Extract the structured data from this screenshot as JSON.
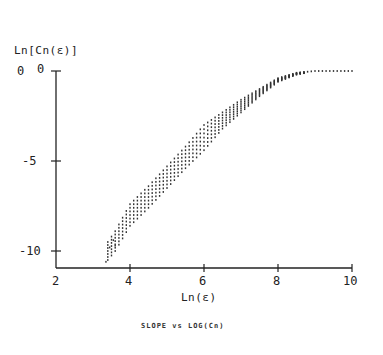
{
  "chart_data": {
    "type": "scatter",
    "title": "",
    "caption": "SLOPE vs LOG(Cn)",
    "xlabel": "Ln(ε)",
    "ylabel": "Ln[Cn(ε)]",
    "xlim": [
      2,
      10
    ],
    "ylim": [
      -11,
      0
    ],
    "x_ticks": [
      2,
      4,
      6,
      8,
      10
    ],
    "x_tick_labels": [
      "2",
      "4",
      "6",
      "8",
      "10"
    ],
    "y_ticks": [
      0,
      -5,
      -10
    ],
    "y_tick_labels": [
      "0",
      "-5",
      "-10"
    ],
    "y_extra_label": "0",
    "grid": false,
    "legend": null,
    "series": [
      {
        "name": "correlation sum curves",
        "description": "Band of densely-spaced dotted curves, rising roughly linearly then saturating at 0",
        "band": [
          {
            "x": 3.4,
            "y_low": -10.5,
            "y_high": -9.5
          },
          {
            "x": 3.6,
            "y_low": -10.0,
            "y_high": -8.9
          },
          {
            "x": 4.0,
            "y_low": -8.6,
            "y_high": -7.4
          },
          {
            "x": 4.5,
            "y_low": -7.6,
            "y_high": -6.4
          },
          {
            "x": 5.0,
            "y_low": -6.5,
            "y_high": -5.3
          },
          {
            "x": 5.5,
            "y_low": -5.4,
            "y_high": -4.2
          },
          {
            "x": 6.0,
            "y_low": -4.4,
            "y_high": -3.0
          },
          {
            "x": 6.5,
            "y_low": -3.2,
            "y_high": -2.3
          },
          {
            "x": 7.0,
            "y_low": -2.3,
            "y_high": -1.6
          },
          {
            "x": 7.5,
            "y_low": -1.4,
            "y_high": -1.0
          },
          {
            "x": 8.0,
            "y_low": -0.6,
            "y_high": -0.4
          },
          {
            "x": 8.5,
            "y_low": -0.2,
            "y_high": -0.1
          },
          {
            "x": 9.0,
            "y_low": 0.0,
            "y_high": 0.0
          },
          {
            "x": 9.5,
            "y_low": 0.0,
            "y_high": 0.0
          },
          {
            "x": 10.0,
            "y_low": 0.0,
            "y_high": 0.0
          }
        ]
      }
    ]
  },
  "labels": {
    "ylabel": "Ln[Cn(ε)]",
    "xlabel": "Ln(ε)",
    "caption": "SLOPE vs LOG(Cn)",
    "y_extra": "0",
    "y0": "0",
    "y5": "-5",
    "y10": "-10",
    "x2": "2",
    "x4": "4",
    "x6": "6",
    "x8": "8",
    "x10": "10"
  },
  "colors": {
    "ink": "#222222",
    "points": "#333333",
    "background": "#ffffff"
  }
}
